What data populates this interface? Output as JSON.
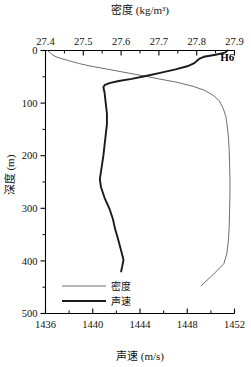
{
  "figure": {
    "station_label": "H6",
    "top_axis_title": "密度 (kg/m³)",
    "bottom_axis_title": "声速 (m/s)",
    "left_axis_title": "深度 (m)"
  },
  "legend": {
    "items": [
      {
        "label": "密度",
        "color": "#6e6e6e",
        "style": "thin"
      },
      {
        "label": "声速",
        "color": "#1a1a1a",
        "style": "thick"
      }
    ]
  },
  "axes": {
    "top": {
      "title": "密度 (kg/m³)",
      "min": 27.4,
      "max": 27.9,
      "ticks": [
        "27.4",
        "27.5",
        "27.6",
        "27.7",
        "27.8",
        "27.9"
      ],
      "tick_values": [
        27.4,
        27.5,
        27.6,
        27.7,
        27.8,
        27.9
      ],
      "minor_step": 0.05
    },
    "bottom": {
      "title": "声速 (m/s)",
      "min": 1436,
      "max": 1452,
      "ticks": [
        "1436",
        "1440",
        "1444",
        "1448",
        "1452"
      ],
      "tick_values": [
        1436,
        1440,
        1444,
        1448,
        1452
      ],
      "minor_step": 2
    },
    "left": {
      "title": "深度 (m)",
      "min": 0,
      "max": 500,
      "inverted": true,
      "ticks": [
        "0",
        "100",
        "200",
        "300",
        "400",
        "500"
      ],
      "tick_values": [
        0,
        100,
        200,
        300,
        400,
        500
      ],
      "minor_step": 50
    }
  },
  "chart_data": {
    "type": "line",
    "title": "",
    "xlabel": "声速 (m/s)",
    "ylabel": "深度 (m)",
    "xlim": [
      1436,
      1452
    ],
    "ylim": [
      0,
      500
    ],
    "y_inverted": true,
    "grid": false,
    "legend_position": "bottom-left",
    "annotations": [
      {
        "text": "H6",
        "x": 1451.3,
        "y": 12
      }
    ],
    "series": [
      {
        "name": "声速",
        "axis": "bottom",
        "unit": "m/s",
        "color": "#1a1a1a",
        "linewidth": "thick",
        "x": [
          1451.4,
          1451.2,
          1450.4,
          1449.4,
          1449.0,
          1448.8,
          1448.6,
          1448.0,
          1447.0,
          1445.8,
          1444.6,
          1443.3,
          1442.2,
          1441.4,
          1441.0,
          1440.9,
          1441.0,
          1441.1,
          1441.2,
          1441.2,
          1441.1,
          1441.0,
          1440.9,
          1440.8,
          1440.7,
          1440.6,
          1440.7,
          1441.0,
          1441.4,
          1441.7,
          1441.9,
          1442.1,
          1442.4,
          1442.6,
          1442.5,
          1442.4
        ],
        "y": [
          0,
          4,
          8,
          12,
          16,
          20,
          24,
          30,
          36,
          42,
          48,
          54,
          58,
          62,
          66,
          70,
          80,
          100,
          120,
          140,
          160,
          180,
          200,
          215,
          230,
          245,
          260,
          280,
          300,
          320,
          340,
          355,
          380,
          398,
          410,
          420
        ]
      },
      {
        "name": "密度",
        "axis": "top",
        "unit": "kg/m³",
        "color": "#6e6e6e",
        "linewidth": "thin",
        "x": [
          27.405,
          27.41,
          27.415,
          27.42,
          27.428,
          27.44,
          27.455,
          27.47,
          27.49,
          27.515,
          27.545,
          27.575,
          27.605,
          27.635,
          27.665,
          27.7,
          27.745,
          27.79,
          27.822,
          27.845,
          27.86,
          27.87,
          27.877,
          27.881,
          27.884,
          27.886,
          27.887,
          27.888,
          27.888,
          27.887,
          27.886,
          27.884,
          27.88,
          27.872,
          27.845,
          27.812
        ],
        "y": [
          0,
          3,
          6,
          9,
          12,
          15,
          18,
          21,
          25,
          29,
          33,
          37,
          41,
          45,
          49,
          54,
          60,
          68,
          76,
          86,
          96,
          110,
          125,
          145,
          165,
          190,
          215,
          245,
          275,
          305,
          335,
          360,
          385,
          405,
          425,
          447
        ]
      }
    ]
  }
}
